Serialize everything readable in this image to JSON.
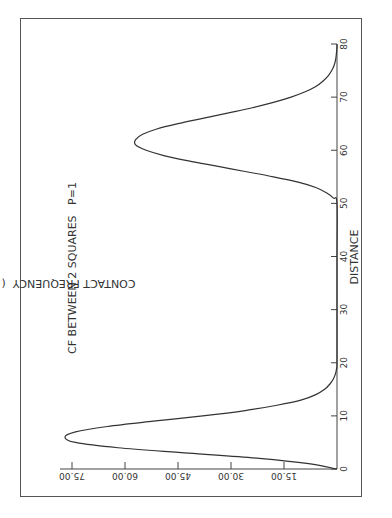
{
  "chart_data": {
    "type": "line",
    "orientation": "rotated-90-ccw",
    "title": "CF BETWEEN 2 SQUARES   P=1",
    "xlabel": "DISTANCE",
    "ylabel": "CONTACT FREQUENCY  ( * 10   +1 )",
    "xlim": [
      0,
      80
    ],
    "ylim": [
      0,
      75
    ],
    "x_ticks": [
      0,
      10,
      20,
      30,
      40,
      50,
      60,
      70,
      80
    ],
    "x_tick_labels": [
      "0",
      "10",
      "20",
      "30",
      "40",
      "50",
      "60",
      "70",
      "80"
    ],
    "y_ticks": [
      15,
      30,
      45,
      60,
      75
    ],
    "y_tick_labels": [
      "15.00",
      "30.00",
      "45.00",
      "60.00",
      "75.00"
    ],
    "grid": false,
    "series": [
      {
        "name": "CF",
        "x": [
          0,
          1,
          2,
          3,
          4,
          5,
          6,
          7,
          8,
          9,
          10,
          11,
          12,
          13,
          14,
          15,
          16,
          17,
          18,
          19,
          20,
          30,
          40,
          50,
          51,
          52,
          53,
          54,
          55,
          56,
          57,
          58,
          59,
          60,
          61,
          62,
          63,
          64,
          65,
          66,
          67,
          68,
          69,
          70,
          71,
          72,
          73,
          74,
          75,
          76,
          77,
          78,
          79,
          80
        ],
        "y": [
          0,
          8,
          22,
          42,
          62,
          74,
          77,
          74,
          65,
          52,
          38,
          26,
          17,
          10,
          6,
          3.5,
          2,
          1,
          0.4,
          0.1,
          0,
          0,
          0,
          0,
          1,
          3,
          6,
          11,
          18,
          26,
          34,
          42,
          49,
          54,
          57,
          57,
          55,
          51,
          45,
          38,
          31,
          24,
          18,
          13,
          9,
          6,
          4,
          2.5,
          1.5,
          0.8,
          0.4,
          0.2,
          0.05,
          0
        ]
      }
    ]
  }
}
